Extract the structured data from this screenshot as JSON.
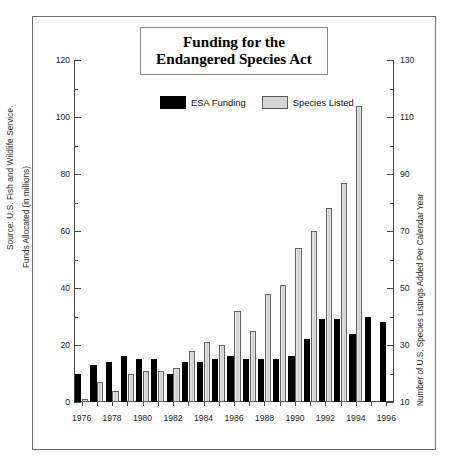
{
  "title": "Funding for the\nEndangered Species Act",
  "title_line1": "Funding for the",
  "title_line2": "Endangered Species Act",
  "source_credit": "Source: U.S. Fish and Wildlife Service.",
  "legend": {
    "items": [
      {
        "label": "ESA Funding",
        "swatch": "dark-swatch",
        "color": "#000000"
      },
      {
        "label": "Species Listed",
        "swatch": "light-swatch",
        "color": "#d6d6d6"
      }
    ]
  },
  "axes": {
    "left": {
      "label": "Funds Allocated (in millions)",
      "ticks": [
        0,
        20,
        40,
        60,
        80,
        100,
        120
      ],
      "minor_ticks": [
        10,
        30,
        50,
        70,
        90,
        110
      ],
      "min": 0,
      "max": 120
    },
    "right": {
      "label": "Number of U.S. Species Listings Added Per Calendar Year",
      "ticks": [
        10,
        30,
        50,
        70,
        90,
        110,
        130
      ],
      "minor_ticks": [
        20,
        40,
        60,
        80,
        100,
        120
      ],
      "min": 10,
      "max": 130
    },
    "x": {
      "labels": [
        "1976",
        "1978",
        "1980",
        "1982",
        "1984",
        "1986",
        "1988",
        "1990",
        "1992",
        "1994",
        "1996"
      ]
    }
  },
  "chart_data": {
    "type": "bar",
    "title": "Funding for the Endangered Species Act",
    "xlabel": "",
    "ylabel": "Funds Allocated (in millions)",
    "y2label": "Number of U.S. Species Listings Added Per Calendar Year",
    "ylim": [
      0,
      120
    ],
    "y2lim": [
      10,
      130
    ],
    "grid": false,
    "legend_position": "top-center",
    "categories": [
      "1976",
      "1977",
      "1978",
      "1979",
      "1980",
      "1981",
      "1982",
      "1983",
      "1984",
      "1985",
      "1986",
      "1987",
      "1988",
      "1989",
      "1990",
      "1991",
      "1992",
      "1993",
      "1994",
      "1995",
      "1996"
    ],
    "series": [
      {
        "name": "ESA Funding",
        "axis": "left",
        "units": "millions of dollars",
        "values": [
          10,
          13,
          14,
          16,
          15,
          15,
          10,
          14,
          14,
          15,
          16,
          15,
          15,
          15,
          16,
          22,
          29,
          29,
          24,
          30,
          28
        ]
      },
      {
        "name": "Species Listed",
        "axis": "right",
        "units": "species listings added per calendar year",
        "values": [
          11,
          17,
          14,
          20,
          21,
          21,
          22,
          28,
          31,
          30,
          42,
          35,
          48,
          51,
          64,
          70,
          78,
          87,
          114,
          0,
          0
        ]
      }
    ]
  },
  "bars": [
    {
      "year": "1976",
      "funding": 10,
      "listed": 11
    },
    {
      "year": "1977",
      "funding": 13,
      "listed": 17
    },
    {
      "year": "1978",
      "funding": 14,
      "listed": 14
    },
    {
      "year": "1979",
      "funding": 16,
      "listed": 20
    },
    {
      "year": "1980",
      "funding": 15,
      "listed": 21
    },
    {
      "year": "1981",
      "funding": 15,
      "listed": 21
    },
    {
      "year": "1982",
      "funding": 10,
      "listed": 22
    },
    {
      "year": "1983",
      "funding": 14,
      "listed": 28
    },
    {
      "year": "1984",
      "funding": 14,
      "listed": 31
    },
    {
      "year": "1985",
      "funding": 15,
      "listed": 30
    },
    {
      "year": "1986",
      "funding": 16,
      "listed": 42
    },
    {
      "year": "1987",
      "funding": 15,
      "listed": 35
    },
    {
      "year": "1988",
      "funding": 15,
      "listed": 48
    },
    {
      "year": "1989",
      "funding": 15,
      "listed": 51
    },
    {
      "year": "1990",
      "funding": 16,
      "listed": 64
    },
    {
      "year": "1991",
      "funding": 22,
      "listed": 70
    },
    {
      "year": "1992",
      "funding": 29,
      "listed": 78
    },
    {
      "year": "1993",
      "funding": 29,
      "listed": 87
    },
    {
      "year": "1994",
      "funding": 24,
      "listed": 114
    },
    {
      "year": "1995",
      "funding": 30,
      "listed": null
    },
    {
      "year": "1996",
      "funding": 28,
      "listed": null
    }
  ]
}
